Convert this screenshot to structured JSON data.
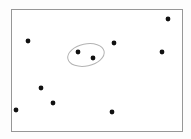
{
  "figure": {
    "title": "",
    "background_color": "#fdfdfd",
    "width": 191,
    "height": 139
  },
  "chart_data": {
    "type": "scatter",
    "title": "",
    "xlabel": "",
    "ylabel": "",
    "grid": false,
    "legend": null,
    "axis_visible": false,
    "xlim": [
      0,
      191
    ],
    "ylim": [
      0,
      139
    ],
    "frame": {
      "x": 11,
      "y": 9,
      "width": 171,
      "height": 122,
      "stroke_color": "#979797",
      "fill_color": "#ffffff",
      "stroke_width": 1
    },
    "point_style": {
      "color": "#111111",
      "radius": 2.4,
      "marker": "circle"
    },
    "series": [
      {
        "name": "points-outside-cluster",
        "color": "#111111",
        "points": [
          {
            "label": "p1",
            "x": 28,
            "y": 41
          },
          {
            "label": "p2",
            "x": 114,
            "y": 43
          },
          {
            "label": "p3",
            "x": 168,
            "y": 19
          },
          {
            "label": "p4",
            "x": 162,
            "y": 52
          },
          {
            "label": "p5",
            "x": 41,
            "y": 88
          },
          {
            "label": "p6",
            "x": 53,
            "y": 103
          },
          {
            "label": "p7",
            "x": 16,
            "y": 110
          },
          {
            "label": "p8",
            "x": 112,
            "y": 112
          }
        ]
      },
      {
        "name": "points-inside-cluster",
        "color": "#111111",
        "points": [
          {
            "label": "c1",
            "x": 78,
            "y": 52
          },
          {
            "label": "c2",
            "x": 93,
            "y": 58
          }
        ]
      }
    ],
    "annotations": [
      {
        "type": "ellipse",
        "name": "cluster-ellipse",
        "cx": 86,
        "cy": 55,
        "rx": 18.5,
        "ry": 11,
        "rotation": -12,
        "stroke_color": "#b3b3b3",
        "fill": "none",
        "stroke_width": 1,
        "encloses": [
          "c1",
          "c2"
        ]
      }
    ]
  }
}
